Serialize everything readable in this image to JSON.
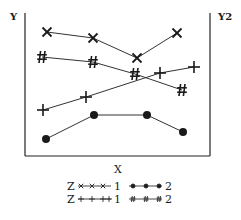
{
  "chart_data": {
    "type": "line",
    "title": "",
    "xlabel": "X",
    "ylabel": "Y",
    "y2label": "Y2",
    "grid": false,
    "legend_position": "bottom",
    "x": [
      1,
      2,
      3,
      4
    ],
    "series": [
      {
        "name": "Z 1 (x markers)",
        "legend_label": "Z",
        "legend_index": "1",
        "marker": "x",
        "points": [
          [
            47,
            32
          ],
          [
            93,
            38
          ],
          [
            137,
            58
          ],
          [
            177,
            33
          ]
        ]
      },
      {
        "name": "Z 2 (dot markers)",
        "legend_label": "",
        "legend_index": "2",
        "marker": "dot",
        "points": [
          [
            46,
            139
          ],
          [
            94,
            115
          ],
          [
            147,
            115
          ],
          [
            183,
            132
          ]
        ]
      },
      {
        "name": "Z 1 (plus markers)",
        "legend_label": "Z",
        "legend_index": "1",
        "marker": "plus",
        "points": [
          [
            43,
            110
          ],
          [
            86,
            97
          ],
          [
            160,
            73
          ],
          [
            194,
            67
          ]
        ]
      },
      {
        "name": "Z 2 (hash markers)",
        "legend_label": "",
        "legend_index": "2",
        "marker": "hash",
        "points": [
          [
            42,
            57
          ],
          [
            93,
            62
          ],
          [
            135,
            74
          ],
          [
            182,
            90
          ]
        ]
      }
    ],
    "legend": {
      "rows": [
        {
          "z": "Z",
          "left_index": "1",
          "right_index": "2"
        },
        {
          "z": "Z",
          "left_index": "1",
          "right_index": "2"
        }
      ]
    }
  },
  "labels": {
    "y": "Y",
    "y2": "Y2",
    "x": "X",
    "legend_z1": "Z",
    "legend_z2": "Z",
    "legend_r1_idx1": "1",
    "legend_r1_idx2": "2",
    "legend_r2_idx1": "1",
    "legend_r2_idx2": "2"
  }
}
